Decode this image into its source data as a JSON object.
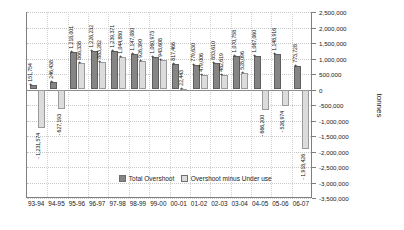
{
  "chart_data": {
    "type": "bar",
    "title": "",
    "xlabel": "",
    "ylabel": "tonnes",
    "ylim": [
      -3500000,
      2500000
    ],
    "ytick_step": 500000,
    "grid": true,
    "legend_position": "inside-bottom-center",
    "categories": [
      "93-94",
      "94-95",
      "95-96",
      "96-97",
      "97-98",
      "98-99",
      "99-00",
      "00-01",
      "01-02",
      "02-03",
      "03-04",
      "04-05",
      "05-06",
      "06-07"
    ],
    "ytick_labels": [
      "2,500,000",
      "2,000,000",
      "1,500,000",
      "1,000,000",
      "500,000",
      "0",
      "-500,000",
      "-1,000,000",
      "-1,500,000",
      "-2,000,000",
      "-2,500,000",
      "-3,000,000",
      "-3,500,000"
    ],
    "series": [
      {
        "name": "Total Overshoot",
        "color": "#858585",
        "values": [
          151754,
          246438,
          1218001,
          1226232,
          1239371,
          1147080,
          1060973,
          817466,
          779630,
          853610,
          1070758,
          1067060,
          1148916,
          773728
        ],
        "labels": [
          "+ 151,754",
          "+ 246,438",
          "+ 1,218,001",
          "+ 1,226,232",
          "+ 1,239,371",
          "+ 1,147,080",
          "+ 1,060,973",
          "+ 817,466",
          "+ 779,630",
          "+ 853,610",
          "+ 1,070,758",
          "+ 1,067,060",
          "+ 1,148,916",
          "+ 773,728"
        ]
      },
      {
        "name": "Overshoot minus Under use",
        "color": "#dcdcdc",
        "values": [
          -1231574,
          -627193,
          866338,
          883282,
          1044880,
          926390,
          943608,
          22443,
          479006,
          482619,
          528096,
          -666200,
          -526974,
          -1918426
        ],
        "labels": [
          "- 1,231,574",
          "- 627,193",
          "+ 866,338",
          "+ 883,282",
          "+ 1,044,880",
          "+ 926,390",
          "+ 943,608",
          "+ 22,443",
          "+ 479,006",
          "+ 482,619",
          "+ 528,096",
          "- 666,200",
          "- 526,974",
          "- 1,918,426"
        ]
      }
    ]
  },
  "legend": {
    "items": [
      {
        "label": "Total Overshoot",
        "color": "#858585"
      },
      {
        "label": "Overshoot minus Under use",
        "color": "#dcdcdc"
      }
    ]
  },
  "axis": {
    "y_title": "tonnes"
  }
}
